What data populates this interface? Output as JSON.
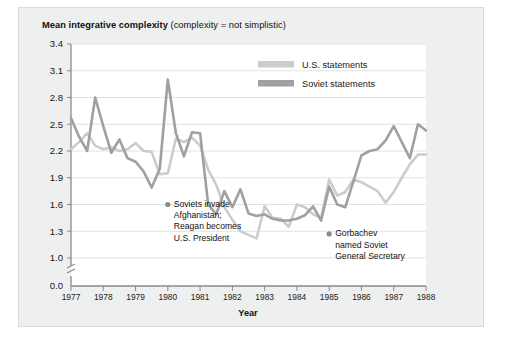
{
  "chart_data": {
    "type": "line",
    "title": "Mean integrative complexity (complexity = not simplistic)",
    "title_bold_part": "Mean integrative complexity",
    "title_rest_part": " (complexity = not simplistic)",
    "xlabel": "Year",
    "ylabel": "",
    "ylim": [
      1.0,
      3.4
    ],
    "y_axis_break": true,
    "y_zero_label": "0.0",
    "yticks": [
      "3.4",
      "3.1",
      "2.8",
      "2.5",
      "2.2",
      "1.9",
      "1.6",
      "1.3",
      "1.0",
      "0.0"
    ],
    "ytick_values": [
      3.4,
      3.1,
      2.8,
      2.5,
      2.2,
      1.9,
      1.6,
      1.3,
      1.0
    ],
    "xticks": [
      "1977",
      "1978",
      "1979",
      "1980",
      "1981",
      "1982",
      "1983",
      "1984",
      "1985",
      "1986",
      "1987",
      "1988"
    ],
    "xlim": [
      1977,
      1988
    ],
    "grid": "horizontal",
    "legend_position": "top-center",
    "colors": {
      "us": "#cccccc",
      "soviet": "#a0a0a0",
      "grid": "#e2e2e2",
      "axis": "#8a8a8a",
      "panel_bg": "#eef0ef",
      "plot_bg": "#ffffff",
      "text": "#111111"
    },
    "series": [
      {
        "name": "U.S. statements",
        "color": "#cccccc",
        "x": [
          1977.0,
          1977.25,
          1977.5,
          1977.75,
          1978.0,
          1978.25,
          1978.5,
          1978.75,
          1979.0,
          1979.25,
          1979.5,
          1979.75,
          1980.0,
          1980.25,
          1980.5,
          1980.75,
          1981.0,
          1981.25,
          1981.5,
          1981.75,
          1982.0,
          1982.25,
          1982.5,
          1982.75,
          1983.0,
          1983.25,
          1983.5,
          1983.75,
          1984.0,
          1984.25,
          1984.5,
          1984.75,
          1985.0,
          1985.25,
          1985.5,
          1985.75,
          1986.0,
          1986.25,
          1986.5,
          1986.75,
          1987.0,
          1987.25,
          1987.5,
          1987.75,
          1988.0
        ],
        "y": [
          2.22,
          2.3,
          2.4,
          2.26,
          2.22,
          2.24,
          2.2,
          2.22,
          2.29,
          2.2,
          2.19,
          1.94,
          1.95,
          2.34,
          2.3,
          2.35,
          2.26,
          1.99,
          1.82,
          1.57,
          1.43,
          1.3,
          1.26,
          1.22,
          1.58,
          1.45,
          1.44,
          1.35,
          1.6,
          1.57,
          1.49,
          1.45,
          1.88,
          1.7,
          1.74,
          1.88,
          1.85,
          1.8,
          1.75,
          1.62,
          1.74,
          1.9,
          2.05,
          2.16,
          2.16
        ]
      },
      {
        "name": "Soviet statements",
        "color": "#a0a0a0",
        "x": [
          1977.0,
          1977.25,
          1977.5,
          1977.75,
          1978.0,
          1978.25,
          1978.5,
          1978.75,
          1979.0,
          1979.25,
          1979.5,
          1979.75,
          1980.0,
          1980.25,
          1980.5,
          1980.75,
          1981.0,
          1981.25,
          1981.5,
          1981.75,
          1982.0,
          1982.25,
          1982.5,
          1982.75,
          1983.0,
          1983.25,
          1983.5,
          1983.75,
          1984.0,
          1984.25,
          1984.5,
          1984.75,
          1985.0,
          1985.25,
          1985.5,
          1985.75,
          1986.0,
          1986.25,
          1986.5,
          1986.75,
          1987.0,
          1987.25,
          1987.5,
          1987.75,
          1988.0
        ],
        "y": [
          2.57,
          2.36,
          2.2,
          2.8,
          2.48,
          2.18,
          2.33,
          2.12,
          2.08,
          1.97,
          1.79,
          2.0,
          3.0,
          2.4,
          2.14,
          2.41,
          2.4,
          1.6,
          1.49,
          1.75,
          1.57,
          1.77,
          1.5,
          1.47,
          1.49,
          1.44,
          1.42,
          1.42,
          1.44,
          1.48,
          1.58,
          1.42,
          1.8,
          1.6,
          1.57,
          1.86,
          2.15,
          2.2,
          2.22,
          2.32,
          2.48,
          2.3,
          2.12,
          2.5,
          2.43
        ]
      }
    ],
    "annotations": [
      {
        "id": "soviets-invade-afghanistan",
        "lines": [
          "Soviets invade",
          "Afghanistan;",
          "Reagan becomes",
          "U.S. President"
        ],
        "marker_x": 1980.0,
        "marker_y": 1.6
      },
      {
        "id": "gorbachev-named",
        "lines": [
          "Gorbachev",
          "named Soviet",
          "General Secretary"
        ],
        "marker_x": 1985.0,
        "marker_y": 1.27
      }
    ]
  }
}
